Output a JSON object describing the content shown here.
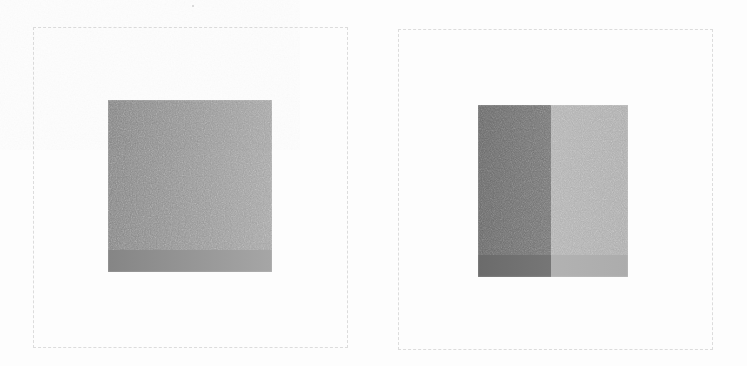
{
  "figure": {
    "canvas": {
      "width": 747,
      "height": 366
    },
    "background_color": "#fdfdfd",
    "caption": "",
    "panel_count": 2
  },
  "panels": [
    {
      "id": "panel-left",
      "name": "uniform-gray-patch-panel",
      "label": "",
      "frame": {
        "x": 33,
        "y": 27,
        "width": 315,
        "height": 321,
        "style": "dashed",
        "color": "#dcdcdc",
        "thickness": 1
      },
      "patch": {
        "name": "uniform-gray-square",
        "x": 108,
        "y": 100,
        "width": 164,
        "height": 172,
        "segments": [
          {
            "name": "whole-square",
            "offset_pct": 0,
            "width_pct": 100,
            "fill_start": "#858585",
            "fill_end": "#a6a6a6",
            "mean_gray": "#8f8f8f",
            "gradient": "horizontal"
          }
        ]
      }
    },
    {
      "id": "panel-right",
      "name": "split-gray-patch-panel",
      "label": "",
      "frame": {
        "x": 398,
        "y": 29,
        "width": 315,
        "height": 321,
        "style": "dashed",
        "color": "#dcdcdc",
        "thickness": 1
      },
      "patch": {
        "name": "split-gray-square",
        "x": 478,
        "y": 105,
        "width": 150,
        "height": 172,
        "divider_x_pct": 48.7,
        "segments": [
          {
            "name": "dark-half",
            "offset_pct": 0,
            "width_pct": 48.7,
            "fill_start": "#6b6b6b",
            "fill_end": "#767676",
            "mean_gray": "#6e6e6e",
            "gradient": "horizontal"
          },
          {
            "name": "light-half",
            "offset_pct": 48.7,
            "width_pct": 51.3,
            "fill_start": "#b2b2b2",
            "fill_end": "#acacac",
            "mean_gray": "#b0b0b0",
            "gradient": "horizontal"
          }
        ]
      }
    }
  ],
  "artifacts": [
    {
      "name": "scan-speck",
      "x": 192,
      "y": 5,
      "size": 2,
      "color": "#cfcfcf"
    }
  ]
}
